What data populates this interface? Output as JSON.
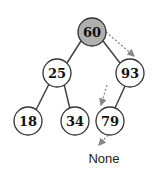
{
  "diagram": {
    "type": "binary-search-tree",
    "highlight_color": "#b0b0b0",
    "nodes": [
      {
        "id": "n60",
        "value": "60",
        "x": 92,
        "y": 32,
        "highlighted": true
      },
      {
        "id": "n25",
        "value": "25",
        "x": 57,
        "y": 73
      },
      {
        "id": "n93",
        "value": "93",
        "x": 130,
        "y": 73
      },
      {
        "id": "n18",
        "value": "18",
        "x": 28,
        "y": 121
      },
      {
        "id": "n34",
        "value": "34",
        "x": 75,
        "y": 121
      },
      {
        "id": "n79",
        "value": "79",
        "x": 110,
        "y": 121
      }
    ],
    "edges": [
      [
        "n60",
        "n25"
      ],
      [
        "n60",
        "n93"
      ],
      [
        "n25",
        "n18"
      ],
      [
        "n25",
        "n34"
      ],
      [
        "n93",
        "n79"
      ]
    ],
    "search_path": [
      "60",
      "93",
      "79",
      "None"
    ],
    "terminal_label": "None"
  }
}
